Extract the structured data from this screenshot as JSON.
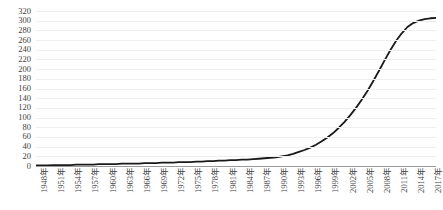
{
  "chart_data": {
    "type": "line",
    "title": "",
    "title_clipped": true,
    "xlabel": "",
    "ylabel": "",
    "ylim": [
      0,
      320
    ],
    "ytick_step": 20,
    "ytick_labels": [
      "320",
      "300",
      "280",
      "260",
      "240",
      "220",
      "200",
      "180",
      "160",
      "140",
      "120",
      "100",
      "80",
      "60",
      "40",
      "20",
      "0"
    ],
    "grid": true,
    "grid_axis": "y",
    "legend": false,
    "line_color": "#1a1a1a",
    "line_width": 1.8,
    "xtick_labels": [
      "1948年",
      "1951年",
      "1954年",
      "1957年",
      "1960年",
      "1963年",
      "1966年",
      "1969年",
      "1972年",
      "1975年",
      "1978年",
      "1981年",
      "1984年",
      "1987年",
      "1990年",
      "1993年",
      "1996年",
      "1999年",
      "2002年",
      "2005年",
      "2008年",
      "2011年",
      "2014年",
      "2017年"
    ],
    "xtick_step_years": 3,
    "x": [
      1948,
      1949,
      1950,
      1951,
      1952,
      1953,
      1954,
      1955,
      1956,
      1957,
      1958,
      1959,
      1960,
      1961,
      1962,
      1963,
      1964,
      1965,
      1966,
      1967,
      1968,
      1969,
      1970,
      1971,
      1972,
      1973,
      1974,
      1975,
      1976,
      1977,
      1978,
      1979,
      1980,
      1981,
      1982,
      1983,
      1984,
      1985,
      1986,
      1987,
      1988,
      1989,
      1990,
      1991,
      1992,
      1993,
      1994,
      1995,
      1996,
      1997,
      1998,
      1999,
      2000,
      2001,
      2002,
      2003,
      2004,
      2005,
      2006,
      2007,
      2008,
      2009,
      2010,
      2011,
      2012,
      2013,
      2014,
      2015,
      2016,
      2017,
      2018
    ],
    "values": [
      1,
      1,
      1,
      2,
      2,
      2,
      2,
      3,
      3,
      3,
      3,
      4,
      4,
      4,
      4,
      5,
      5,
      5,
      5,
      6,
      6,
      6,
      7,
      7,
      7,
      8,
      8,
      8,
      9,
      9,
      10,
      10,
      11,
      11,
      12,
      12,
      13,
      13,
      14,
      15,
      16,
      17,
      18,
      20,
      22,
      25,
      29,
      33,
      38,
      44,
      51,
      59,
      68,
      79,
      91,
      105,
      120,
      137,
      155,
      175,
      196,
      218,
      239,
      258,
      274,
      287,
      295,
      300,
      303,
      305,
      306
    ]
  }
}
